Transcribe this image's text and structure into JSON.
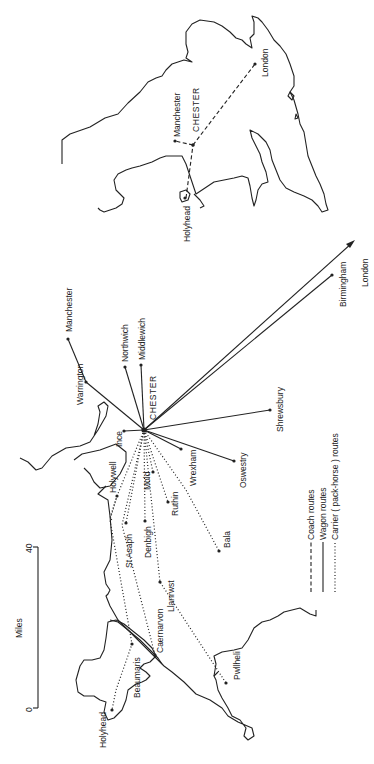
{
  "scale_bar": {
    "unit_label": "Miles",
    "min_label": "0",
    "max_label": "40"
  },
  "legend": {
    "items": [
      {
        "style": "dashed",
        "label": "Coach routes"
      },
      {
        "style": "solid",
        "label": "Wagon routes"
      },
      {
        "style": "dotted",
        "label": "Carrier ( pack-horse ) routes"
      }
    ]
  },
  "main_map": {
    "hub": {
      "name": "CHESTER"
    },
    "wagon_destinations": [
      "Manchester",
      "Warrington",
      "Northwich",
      "Middlewich",
      "Ince",
      "Wrexham",
      "Oswestry",
      "Shrewsbury",
      "Birmingham",
      "London"
    ],
    "carrier_destinations": [
      "Holywell",
      "Mold",
      "Ruthin",
      "Bala",
      "Denbigh",
      "St Asaph",
      "Llanrwst",
      "Caernarvon",
      "Beaumaris",
      "Holyhead",
      "Pwllheli"
    ],
    "labels": {
      "chester": "CHESTER",
      "manchester": "Manchester",
      "warrington": "Warrington",
      "northwich": "Northwich",
      "middlewich": "Middlewich",
      "ince": "Ince",
      "wrexham": "Wrexham",
      "oswestry": "Oswestry",
      "shrewsbury": "Shrewsbury",
      "birmingham": "Birmingham",
      "london": "London",
      "holywell": "Holywell",
      "mold": "Mold",
      "ruthin": "Ruthin",
      "bala": "Bala",
      "denbigh": "Denbigh",
      "st_asaph": "St Asaph",
      "llanrwst": "Llanrwst",
      "caernarvon": "Caernarvon",
      "beaumaris": "Beaumaris",
      "holyhead": "Holyhead",
      "pwllheli": "Pwllheli"
    }
  },
  "inset_map": {
    "coach_route": [
      "Holyhead",
      "CHESTER",
      "London"
    ],
    "labels": {
      "chester": "CHESTER",
      "manchester": "Manchester",
      "london": "London",
      "holyhead": "Holyhead"
    }
  }
}
